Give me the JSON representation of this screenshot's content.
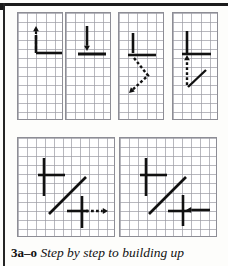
{
  "figure": {
    "caption_label": "3a–o",
    "caption_text": "Step by step to building up",
    "grid_line_color": "#9a9aa2",
    "grid_line_color_major": "#6e6e76",
    "stroke_color": "#111111",
    "panel_border_color": "#8d8d95",
    "background_color": "#ffffff",
    "page_rule_color": "#1a1a1a"
  },
  "panels": [
    {
      "id": "panel-a",
      "name": "panel-step-1",
      "x": 17,
      "y": 12,
      "w": 46,
      "h": 108,
      "cols": 5,
      "rows": 12,
      "cell": 9.2,
      "strokes": [
        {
          "kind": "line",
          "name": "vertical-stroke",
          "x1": 18,
          "y1": 22,
          "x2": 18,
          "y2": 40,
          "width": 2.6,
          "style": "solid"
        },
        {
          "kind": "line",
          "name": "horizontal-stroke",
          "x1": 18,
          "y1": 40,
          "x2": 45,
          "y2": 40,
          "width": 2.6,
          "style": "solid"
        },
        {
          "kind": "arrow",
          "name": "dashed-arrow-up",
          "x1": 18,
          "y1": 36,
          "x2": 18,
          "y2": 13,
          "width": 2.2,
          "style": "dashed",
          "direction": "up"
        }
      ]
    },
    {
      "id": "panel-b",
      "name": "panel-step-2",
      "x": 65,
      "y": 12,
      "w": 46,
      "h": 108,
      "cols": 5,
      "rows": 12,
      "cell": 9.2,
      "strokes": [
        {
          "kind": "line",
          "name": "horizontal-stroke",
          "x1": 12,
          "y1": 41,
          "x2": 40,
          "y2": 41,
          "width": 3.0,
          "style": "solid"
        },
        {
          "kind": "arrow",
          "name": "solid-arrow-down",
          "x1": 21,
          "y1": 13,
          "x2": 21,
          "y2": 38,
          "width": 2.6,
          "style": "solid",
          "direction": "down"
        }
      ]
    },
    {
      "id": "panel-c",
      "name": "panel-step-3",
      "x": 118,
      "y": 12,
      "w": 46,
      "h": 108,
      "cols": 5,
      "rows": 12,
      "cell": 9.2,
      "strokes": [
        {
          "kind": "line",
          "name": "vertical-stroke",
          "x1": 14,
          "y1": 20,
          "x2": 14,
          "y2": 40,
          "width": 2.6,
          "style": "solid"
        },
        {
          "kind": "line",
          "name": "horizontal-stroke",
          "x1": 9,
          "y1": 42,
          "x2": 37,
          "y2": 42,
          "width": 2.6,
          "style": "solid"
        },
        {
          "kind": "arrow",
          "name": "dashed-arrow-diagonal-down-left",
          "x1": 15,
          "y1": 45,
          "x2": 10,
          "y2": 80,
          "width": 2.4,
          "style": "dashed",
          "direction": "down-left",
          "bend": true
        }
      ]
    },
    {
      "id": "panel-d",
      "name": "panel-step-4",
      "x": 172,
      "y": 12,
      "w": 46,
      "h": 108,
      "cols": 5,
      "rows": 12,
      "cell": 9.2,
      "strokes": [
        {
          "kind": "line",
          "name": "vertical-stroke",
          "x1": 14,
          "y1": 18,
          "x2": 14,
          "y2": 40,
          "width": 2.6,
          "style": "solid"
        },
        {
          "kind": "line",
          "name": "horizontal-stroke",
          "x1": 9,
          "y1": 41,
          "x2": 38,
          "y2": 41,
          "width": 2.6,
          "style": "solid"
        },
        {
          "kind": "arrow",
          "name": "dashed-arrow-up",
          "x1": 14,
          "y1": 72,
          "x2": 14,
          "y2": 42,
          "width": 2.4,
          "style": "dashed",
          "direction": "up"
        },
        {
          "kind": "line",
          "name": "diagonal-stroke",
          "x1": 15,
          "y1": 74,
          "x2": 33,
          "y2": 57,
          "width": 2.4,
          "style": "solid"
        }
      ]
    },
    {
      "id": "panel-e",
      "name": "panel-step-5",
      "x": 17,
      "y": 137,
      "w": 98,
      "h": 100,
      "cols": 11,
      "rows": 11,
      "cell": 8.9,
      "strokes": [
        {
          "kind": "line",
          "name": "vertical-stroke-upper",
          "x1": 26,
          "y1": 20,
          "x2": 26,
          "y2": 45,
          "width": 2.6,
          "style": "solid"
        },
        {
          "kind": "line",
          "name": "horizontal-stroke-upper",
          "x1": 20,
          "y1": 37,
          "x2": 47,
          "y2": 37,
          "width": 2.6,
          "style": "solid"
        },
        {
          "kind": "line",
          "name": "vertical-stroke-lower",
          "x1": 26,
          "y1": 45,
          "x2": 26,
          "y2": 58,
          "width": 2.6,
          "style": "solid"
        },
        {
          "kind": "line",
          "name": "diagonal-stroke",
          "x1": 31,
          "y1": 76,
          "x2": 68,
          "y2": 39,
          "width": 2.6,
          "style": "solid"
        },
        {
          "kind": "line",
          "name": "cross-vertical",
          "x1": 64,
          "y1": 58,
          "x2": 64,
          "y2": 90,
          "width": 2.6,
          "style": "solid"
        },
        {
          "kind": "line",
          "name": "cross-horizontal",
          "x1": 49,
          "y1": 73,
          "x2": 70,
          "y2": 73,
          "width": 2.6,
          "style": "solid"
        },
        {
          "kind": "arrow",
          "name": "dashed-arrow-right",
          "x1": 68,
          "y1": 73,
          "x2": 90,
          "y2": 73,
          "width": 2.4,
          "style": "dashed",
          "direction": "right"
        }
      ]
    },
    {
      "id": "panel-f",
      "name": "panel-step-6",
      "x": 119,
      "y": 137,
      "w": 98,
      "h": 100,
      "cols": 11,
      "rows": 11,
      "cell": 8.9,
      "strokes": [
        {
          "kind": "line",
          "name": "vertical-stroke-upper",
          "x1": 26,
          "y1": 20,
          "x2": 26,
          "y2": 45,
          "width": 2.6,
          "style": "solid"
        },
        {
          "kind": "line",
          "name": "horizontal-stroke-upper",
          "x1": 20,
          "y1": 37,
          "x2": 47,
          "y2": 37,
          "width": 2.6,
          "style": "solid"
        },
        {
          "kind": "line",
          "name": "vertical-stroke-lower",
          "x1": 26,
          "y1": 45,
          "x2": 26,
          "y2": 58,
          "width": 2.6,
          "style": "solid"
        },
        {
          "kind": "line",
          "name": "diagonal-stroke",
          "x1": 29,
          "y1": 76,
          "x2": 66,
          "y2": 39,
          "width": 2.6,
          "style": "solid"
        },
        {
          "kind": "line",
          "name": "cross-vertical",
          "x1": 63,
          "y1": 57,
          "x2": 63,
          "y2": 88,
          "width": 2.6,
          "style": "solid"
        },
        {
          "kind": "line",
          "name": "cross-horizontal",
          "x1": 48,
          "y1": 73,
          "x2": 70,
          "y2": 73,
          "width": 2.6,
          "style": "solid"
        },
        {
          "kind": "arrow",
          "name": "solid-arrow-left",
          "x1": 90,
          "y1": 72,
          "x2": 66,
          "y2": 72,
          "width": 2.6,
          "style": "solid",
          "direction": "left"
        }
      ]
    }
  ]
}
